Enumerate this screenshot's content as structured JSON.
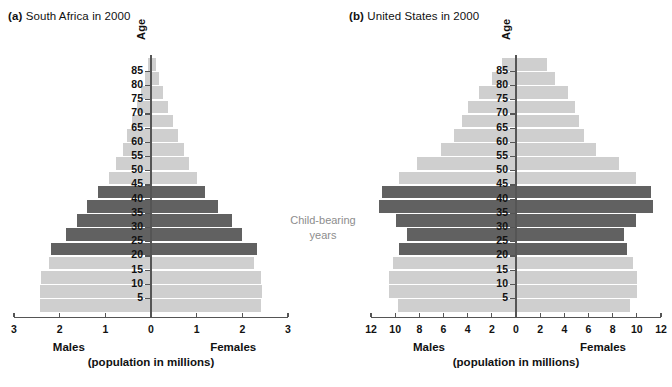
{
  "figure": {
    "annotation": "Child-bearing\nyears",
    "annotation_color": "#8d8d8d",
    "light_bar_color": "#cfcfcf",
    "dark_bar_color": "#616161",
    "axis_color": "#555555"
  },
  "panels": [
    {
      "id": "a",
      "tag": "(a)",
      "title": "South Africa in 2000",
      "y_axis_title": "Age",
      "x_axis_left_label": "Males",
      "x_axis_right_label": "Females",
      "x_axis_units": "(population in millions)",
      "x_ticks": [
        "3",
        "2",
        "1",
        "0",
        "1",
        "2",
        "3"
      ],
      "x_tick_values": [
        -3,
        -2,
        -1,
        0,
        1,
        2,
        3
      ],
      "x_max": 3,
      "age_ticks": [
        "5",
        "10",
        "15",
        "20",
        "25",
        "30",
        "35",
        "40",
        "45",
        "50",
        "55",
        "60",
        "65",
        "70",
        "75",
        "80",
        "85"
      ]
    },
    {
      "id": "b",
      "tag": "(b)",
      "title": "United States in 2000",
      "y_axis_title": "Age",
      "x_axis_left_label": "Males",
      "x_axis_right_label": "Females",
      "x_axis_units": "(population in millions)",
      "x_ticks": [
        "12",
        "10",
        "8",
        "6",
        "4",
        "2",
        "0",
        "2",
        "4",
        "6",
        "8",
        "10",
        "12"
      ],
      "x_tick_values": [
        -12,
        -10,
        -8,
        -6,
        -4,
        -2,
        0,
        2,
        4,
        6,
        8,
        10,
        12
      ],
      "x_max": 12,
      "age_ticks": [
        "5",
        "10",
        "15",
        "20",
        "25",
        "30",
        "35",
        "40",
        "45",
        "50",
        "55",
        "60",
        "65",
        "70",
        "75",
        "80",
        "85"
      ]
    }
  ],
  "chart_data": [
    {
      "type": "bar",
      "subtype": "population-pyramid",
      "title": "(a) South Africa in 2000",
      "xlabel": "(population in millions)",
      "ylabel": "Age",
      "xlim": [
        -3,
        3
      ],
      "grid": false,
      "legend": "none",
      "categories": [
        "0-4",
        "5-9",
        "10-14",
        "15-19",
        "20-24",
        "25-29",
        "30-34",
        "35-39",
        "40-44",
        "45-49",
        "50-54",
        "55-59",
        "60-64",
        "65-69",
        "70-74",
        "75-79",
        "80-84",
        "85+"
      ],
      "series": [
        {
          "name": "Males",
          "values": [
            2.42,
            2.42,
            2.4,
            2.24,
            2.18,
            1.86,
            1.62,
            1.4,
            1.16,
            0.93,
            0.76,
            0.62,
            0.52,
            0.42,
            0.31,
            0.22,
            0.13,
            0.07
          ]
        },
        {
          "name": "Females",
          "values": [
            2.4,
            2.42,
            2.4,
            2.25,
            2.32,
            2.0,
            1.78,
            1.47,
            1.18,
            1.0,
            0.84,
            0.72,
            0.6,
            0.48,
            0.37,
            0.27,
            0.18,
            0.12
          ]
        }
      ],
      "highlighted_categories": [
        "20-24",
        "25-29",
        "30-34",
        "35-39",
        "40-44"
      ],
      "annotation": "Child-bearing years"
    },
    {
      "type": "bar",
      "subtype": "population-pyramid",
      "title": "(b) United States in 2000",
      "xlabel": "(population in millions)",
      "ylabel": "Age",
      "xlim": [
        -12,
        12
      ],
      "grid": false,
      "legend": "none",
      "categories": [
        "0-4",
        "5-9",
        "10-14",
        "15-19",
        "20-24",
        "25-29",
        "30-34",
        "35-39",
        "40-44",
        "45-49",
        "50-54",
        "55-59",
        "60-64",
        "65-69",
        "70-74",
        "75-79",
        "80-84",
        "85+"
      ],
      "series": [
        {
          "name": "Males",
          "values": [
            9.8,
            10.5,
            10.5,
            10.2,
            9.7,
            9.0,
            9.9,
            11.3,
            11.1,
            9.7,
            8.2,
            6.2,
            5.1,
            4.5,
            4.0,
            3.1,
            2.0,
            1.2
          ]
        },
        {
          "name": "Females",
          "values": [
            9.4,
            10.0,
            10.0,
            9.7,
            9.2,
            8.9,
            9.9,
            11.3,
            11.2,
            9.9,
            8.5,
            6.6,
            5.6,
            5.2,
            4.9,
            4.3,
            3.2,
            2.6
          ]
        }
      ],
      "highlighted_categories": [
        "20-24",
        "25-29",
        "30-34",
        "35-39",
        "40-44"
      ],
      "annotation": "Child-bearing years"
    }
  ]
}
